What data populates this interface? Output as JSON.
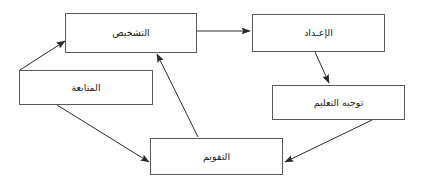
{
  "diagram": {
    "title": "",
    "direction": "rtl",
    "language": "ar",
    "stroke_color": "#5a5a5a",
    "arrow_color": "#2a2a2a",
    "background_color": "#ffffff",
    "nodes": [
      {
        "id": "tashkhis",
        "label": "التشخيص",
        "name": "diagnosis"
      },
      {
        "id": "iadad",
        "label": "الإعـداد",
        "name": "preparation"
      },
      {
        "id": "mutabaa",
        "label": "المتابعة",
        "name": "follow-up"
      },
      {
        "id": "tawjih",
        "label": "توجيه التعليم",
        "name": "teaching-guidance"
      },
      {
        "id": "taqwim",
        "label": "التقويم",
        "name": "evaluation"
      }
    ],
    "edges": [
      {
        "from": "tashkhis",
        "to": "iadad"
      },
      {
        "from": "iadad",
        "to": "tawjih"
      },
      {
        "from": "tawjih",
        "to": "taqwim"
      },
      {
        "from": "taqwim",
        "to": "tashkhis"
      },
      {
        "from": "mutabaa",
        "to": "tashkhis"
      },
      {
        "from": "mutabaa",
        "to": "taqwim"
      }
    ]
  }
}
